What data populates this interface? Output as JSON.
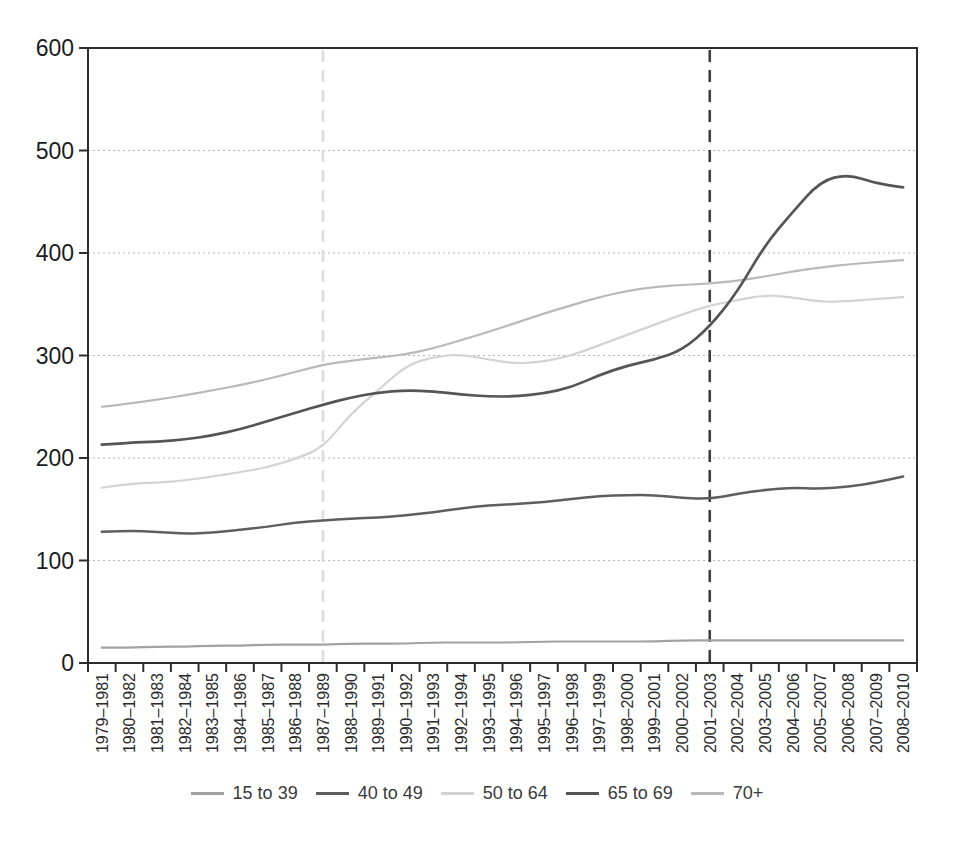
{
  "page": {
    "background": "#ffffff"
  },
  "chart_data": {
    "type": "line",
    "title": "",
    "xlabel": "",
    "ylabel": "",
    "ylim": [
      0,
      600
    ],
    "yticks": [
      0,
      100,
      200,
      300,
      400,
      500,
      600
    ],
    "grid": "horizontal-dotted",
    "legend_position": "bottom",
    "frame": true,
    "categories": [
      "1979–1981",
      "1980–1982",
      "1981–1983",
      "1982–1984",
      "1983–1985",
      "1984–1986",
      "1985–1987",
      "1986–1988",
      "1987–1989",
      "1988–1990",
      "1989–1991",
      "1990–1992",
      "1991–1993",
      "1992–1994",
      "1993–1995",
      "1994–1996",
      "1995–1997",
      "1996–1998",
      "1997–1999",
      "1998–2000",
      "1999–2001",
      "2000–2002",
      "2001–2003",
      "2002–2004",
      "2003–2005",
      "2004–2006",
      "2005–2007",
      "2006–2008",
      "2007–2009",
      "2008–2010"
    ],
    "series": [
      {
        "name": "15 to 39",
        "color": "#a2a2a2",
        "stroke_width": 2.2,
        "values": [
          15,
          15,
          16,
          16,
          17,
          17,
          18,
          18,
          18,
          19,
          19,
          19,
          20,
          20,
          20,
          20,
          21,
          21,
          21,
          21,
          21,
          22,
          22,
          22,
          22,
          22,
          22,
          22,
          22,
          22
        ]
      },
      {
        "name": "40 to 49",
        "color": "#5e5e5e",
        "stroke_width": 2.5,
        "values": [
          128,
          129,
          128,
          126,
          127,
          130,
          133,
          137,
          139,
          141,
          142,
          144,
          147,
          151,
          154,
          155,
          157,
          160,
          163,
          164,
          164,
          161,
          160,
          165,
          169,
          171,
          170,
          172,
          176,
          182
        ]
      },
      {
        "name": "50 to 64",
        "color": "#d3d3d3",
        "stroke_width": 2.2,
        "values": [
          171,
          175,
          176,
          178,
          182,
          186,
          191,
          199,
          210,
          243,
          266,
          290,
          299,
          301,
          296,
          292,
          294,
          300,
          310,
          320,
          330,
          340,
          349,
          354,
          359,
          357,
          352,
          353,
          355,
          357
        ]
      },
      {
        "name": "65 to 69",
        "color": "#555555",
        "stroke_width": 2.7,
        "values": [
          213,
          215,
          216,
          218,
          222,
          228,
          236,
          244,
          252,
          259,
          264,
          266,
          265,
          262,
          260,
          260,
          263,
          269,
          281,
          290,
          296,
          305,
          328,
          362,
          408,
          440,
          470,
          477,
          468,
          464
        ]
      },
      {
        "name": "70+",
        "color": "#b9b9b9",
        "stroke_width": 2.2,
        "values": [
          250,
          253,
          257,
          261,
          266,
          271,
          277,
          284,
          291,
          295,
          298,
          301,
          307,
          315,
          323,
          332,
          341,
          349,
          357,
          363,
          367,
          369,
          370,
          373,
          377,
          382,
          386,
          389,
          391,
          393
        ]
      }
    ],
    "reference_lines": [
      {
        "at_category": "1987–1989",
        "category_index": 8,
        "color": "#dcdcdc",
        "style": "dashed"
      },
      {
        "at_category": "2001–2003",
        "category_index": 22,
        "color": "#3f3f3f",
        "style": "dashed"
      }
    ]
  },
  "colors": {
    "axis_frame": "#2d2d2d",
    "gridline": "#b4b4b4",
    "tick_label": "#1c1c1c",
    "x_label": "#2a2a2a"
  }
}
